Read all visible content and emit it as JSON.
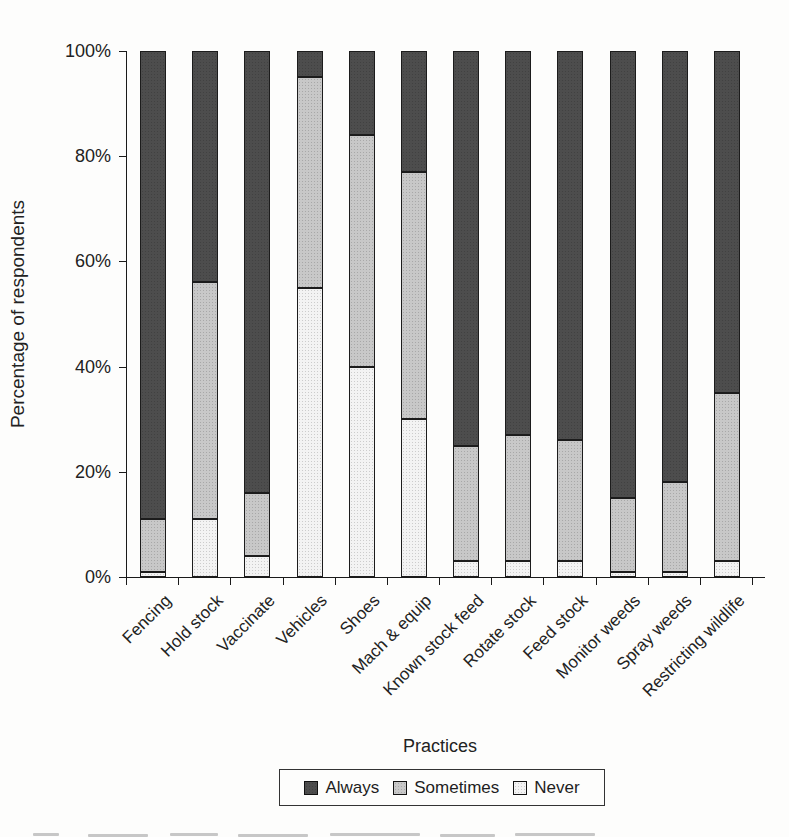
{
  "chart_data": {
    "type": "bar",
    "stacked": true,
    "title": "",
    "xlabel": "Practices",
    "ylabel": "Percentage of respondents",
    "ylim": [
      0,
      100
    ],
    "ytick_values": [
      0,
      20,
      40,
      60,
      80,
      100
    ],
    "ytick_labels": [
      "0%",
      "20%",
      "40%",
      "60%",
      "80%",
      "100%"
    ],
    "grid": false,
    "legend_position": "bottom",
    "categories": [
      "Fencing",
      "Hold stock",
      "Vaccinate",
      "Vehicles",
      "Shoes",
      "Mach & equip",
      "Known stock feed",
      "Rotate stock",
      "Feed stock",
      "Monitor weeds",
      "Spray weeds",
      "Restricting wildlife"
    ],
    "series": [
      {
        "name": "Always",
        "color": "#4d4d4d",
        "values": [
          89,
          44,
          84,
          5,
          16,
          23,
          75,
          73,
          74,
          85,
          82,
          65
        ]
      },
      {
        "name": "Sometimes",
        "color": "#c8c8c8",
        "values": [
          10,
          45,
          12,
          40,
          44,
          47,
          22,
          24,
          23,
          14,
          17,
          32
        ]
      },
      {
        "name": "Never",
        "color": "#f3f3f3",
        "values": [
          1,
          11,
          4,
          55,
          40,
          30,
          3,
          3,
          3,
          1,
          1,
          3
        ]
      }
    ],
    "stack_order_bottom_to_top": [
      "Never",
      "Sometimes",
      "Always"
    ],
    "legend_entries": [
      "Always",
      "Sometimes",
      "Never"
    ]
  }
}
